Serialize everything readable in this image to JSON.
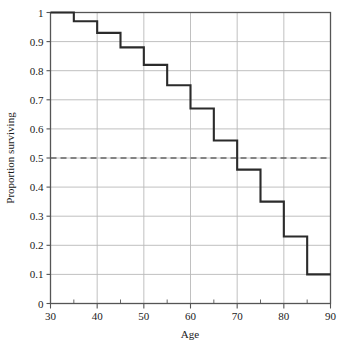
{
  "chart_data": {
    "type": "line",
    "subtype": "step-post",
    "title": "",
    "subtitle": "",
    "xlabel": "Age",
    "ylabel": "Proportion surviving",
    "xlim": [
      30,
      90
    ],
    "ylim": [
      0,
      1
    ],
    "x": [
      30,
      35,
      40,
      45,
      50,
      55,
      60,
      65,
      70,
      75,
      80,
      85,
      90
    ],
    "values": [
      1.0,
      0.97,
      0.93,
      0.88,
      0.82,
      0.75,
      0.67,
      0.56,
      0.46,
      0.35,
      0.23,
      0.1,
      0.1
    ],
    "series": [
      {
        "name": "Proportion surviving",
        "values": [
          1.0,
          0.97,
          0.93,
          0.88,
          0.82,
          0.75,
          0.67,
          0.56,
          0.46,
          0.35,
          0.23,
          0.1,
          0.1
        ]
      }
    ],
    "xticks": [
      30,
      40,
      50,
      60,
      70,
      80,
      90
    ],
    "xticklabels": [
      "30",
      "40",
      "50",
      "60",
      "70",
      "80",
      "90"
    ],
    "xminorticks": [
      35,
      45,
      55,
      65,
      75,
      85
    ],
    "yticks": [
      0,
      0.1,
      0.2,
      0.3,
      0.4,
      0.5,
      0.6,
      0.7,
      0.8,
      0.9,
      1
    ],
    "yticklabels": [
      "0",
      "0.1",
      "0.2",
      "0.3",
      "0.4",
      "0.5",
      "0.6",
      "0.7",
      "0.8",
      "0.9",
      "1"
    ],
    "grid": true,
    "grid_axis": "both",
    "legend": false,
    "legend_position": "none",
    "annotations": [
      {
        "name": "median-reference-line",
        "type": "hline",
        "y": 0.5,
        "style": "dashed",
        "color": "#666666",
        "label": ""
      }
    ],
    "colors": {
      "step_line": "#2b2b2b",
      "grid": "#b9b9b9",
      "axis": "#555555",
      "reference_line": "#777777",
      "background": "#ffffff",
      "text": "#1a1a1a"
    }
  }
}
